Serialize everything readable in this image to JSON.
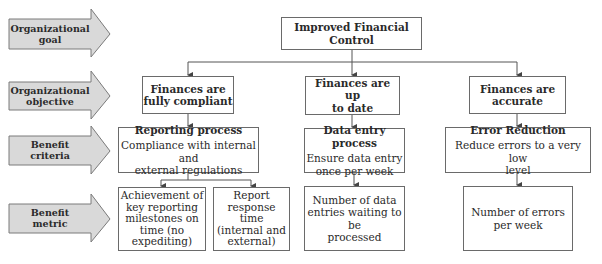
{
  "levels": [
    {
      "label_line1": "Organizational",
      "label_line2": "goal"
    },
    {
      "label_line1": "Organizational",
      "label_line2": "objective"
    },
    {
      "label_line1": "Benefit",
      "label_line2": "criteria"
    },
    {
      "label_line1": "Benefit",
      "label_line2": "metric"
    }
  ],
  "goal": {
    "line1": "Improved Financial",
    "line2": "Control"
  },
  "objectives": [
    {
      "line1": "Finances are",
      "line2": "fully compliant"
    },
    {
      "line1": "Finances are up",
      "line2": "to date"
    },
    {
      "line1": "Finances are",
      "line2": "accurate"
    }
  ],
  "criteria": [
    {
      "title": "Reporting process",
      "line1": "Compliance with internal and",
      "line2": "external regulations"
    },
    {
      "title": "Data entry process",
      "line1": "Ensure data entry",
      "line2": "once per week"
    },
    {
      "title": "Error Reduction",
      "line1": "Reduce errors to a very low",
      "line2": "level"
    }
  ],
  "metrics": [
    {
      "lines": [
        "Achievement of",
        "key reporting",
        "milestones on",
        "time (no",
        "expediting)"
      ]
    },
    {
      "lines": [
        "Report",
        "response time",
        "(internal and",
        "external)"
      ]
    },
    {
      "lines": [
        "Number of data",
        "entries waiting to be",
        "processed"
      ]
    },
    {
      "lines": [
        "Number of errors",
        "per week"
      ]
    }
  ],
  "colors": {
    "arrow_fill": "#d9d9d9",
    "arrow_stroke": "#7a7a7a",
    "line": "#555555"
  }
}
